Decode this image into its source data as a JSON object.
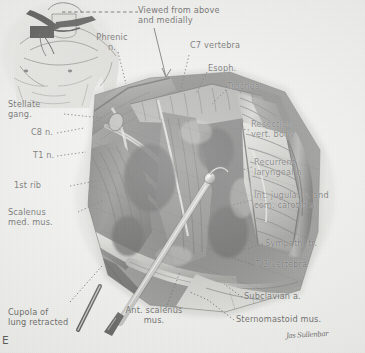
{
  "figure": {
    "kind": "anatomical-surgical-illustration",
    "figure_letter": "E",
    "orientation_note": "Viewed from above\nand medially",
    "signature": "Jas Sullenbar",
    "palette": {
      "paper": "#f0f0ee",
      "ink": "#1c1c1c",
      "artwork_dark": "#1a1a1a",
      "artwork_mid": "#6e6e6e",
      "artwork_light": "#c9c9c5"
    },
    "inset": {
      "name": "body-orientation-inset",
      "description": "line drawing of male torso and neck with supraclavicular incision marked"
    }
  },
  "labels": {
    "orientation": "Viewed from above\nand medially",
    "phrenic": "Phrenic\nn.",
    "c7_vertebra": "C7 vertebra",
    "esophagus": "Esoph.",
    "trachea": "Trachea",
    "resection": "Resection\nvert. body",
    "recurrent_laryngeal": "Recurrent\nlaryngeal n.",
    "jugular_carotid": "Int. jugular v. and\ncom. carotid a.",
    "sympathetic_trunk": "Sympath. tr.",
    "t3_vertebra": "T 3 vertebra",
    "subclavian": "Subclavian a.",
    "sternomastoid": "Sternomastoid mus.",
    "ant_scalenus": "Ant. scalenus\nmus.",
    "cupola": "Cupola of\nlung retracted",
    "scalenus_med": "Scalenus\nmed. mus.",
    "first_rib": "1st rib",
    "t1_nerve": "T1 n.",
    "c8_nerve": "C8 n.",
    "stellate_ganglion": "Stellate\ngang."
  }
}
